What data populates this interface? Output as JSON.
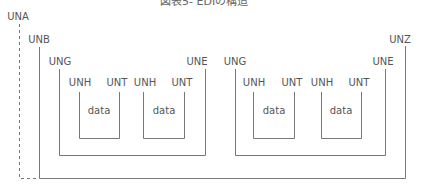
{
  "title": "図表5-  EDIの構造",
  "interchange": {
    "envelope_label": "UNA",
    "header_label": "UNB",
    "trailer_label": "UNZ",
    "groups": [
      {
        "header_label": "UNG",
        "trailer_label": "UNE",
        "messages": [
          {
            "header_label": "UNH",
            "trailer_label": "UNT",
            "content_label": "data"
          },
          {
            "header_label": "UNH",
            "trailer_label": "UNT",
            "content_label": "data"
          }
        ]
      },
      {
        "header_label": "UNG",
        "trailer_label": "UNE",
        "messages": [
          {
            "header_label": "UNH",
            "trailer_label": "UNT",
            "content_label": "data"
          },
          {
            "header_label": "UNH",
            "trailer_label": "UNT",
            "content_label": "data"
          }
        ]
      }
    ]
  },
  "colors": {
    "line": "#777777",
    "text": "#555555",
    "background": "#ffffff"
  }
}
